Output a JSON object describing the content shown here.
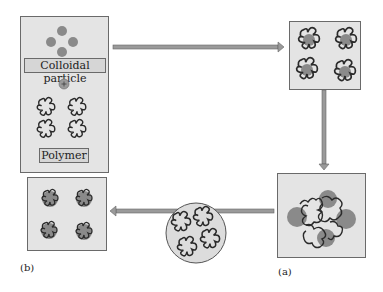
{
  "panel_left": {
    "particle_label": "Colloidal particle",
    "plus_symbol": "+",
    "polymer_label": "Polymer"
  },
  "captions": {
    "a": "(a)",
    "b": "(b)"
  },
  "colors": {
    "box_fill": "#e4e4e4",
    "particle": "#8a8a8a",
    "polymer": "#2a2a2a",
    "arrow": "#9a9a9a"
  }
}
